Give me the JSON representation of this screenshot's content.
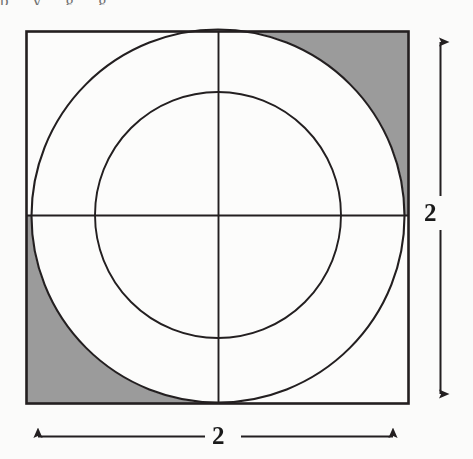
{
  "figure": {
    "background_color": "#fbfbfa",
    "stroke_color": "#231f20",
    "shade_color": "#9b9b9b",
    "square": {
      "label": "square-outline",
      "x": 26,
      "y": 31,
      "width": 383,
      "height": 373,
      "stroke_width": 2.6,
      "side_length_value": "2"
    },
    "outer_circle": {
      "label": "outer-circle-inscribed",
      "cx": 218,
      "cy": 216,
      "r": 187,
      "stroke_width": 2.0,
      "fill": "none"
    },
    "inner_circle": {
      "label": "inner-circle-concentric",
      "cx": 218,
      "cy": 215,
      "r": 123,
      "stroke_width": 1.8,
      "fill": "none"
    },
    "crosshair": {
      "center_x": 218,
      "center_y": 215,
      "stroke_width": 1.8,
      "horizontal": {
        "x1": 26,
        "y1": 215,
        "x2": 409,
        "y2": 215
      },
      "vertical": {
        "x1": 218,
        "y1": 31,
        "x2": 218,
        "y2": 404
      }
    },
    "shaded_regions": [
      {
        "name": "corner-shade-top-right",
        "corner": "top-right",
        "color": "#9b9b9b"
      },
      {
        "name": "corner-shade-bottom-left",
        "corner": "bottom-left",
        "color": "#9b9b9b"
      }
    ],
    "dimensions": [
      {
        "name": "vertical-dimension",
        "label": "2",
        "orientation": "vertical",
        "x": 440,
        "y_start": 33,
        "y_end": 404,
        "arrowheads": "both"
      },
      {
        "name": "horizontal-dimension",
        "label": "2",
        "orientation": "horizontal",
        "y": 436,
        "x_start": 27,
        "x_end": 404,
        "arrowheads": "both"
      }
    ],
    "scan_artifact_top_text": "p    y      g        g"
  }
}
